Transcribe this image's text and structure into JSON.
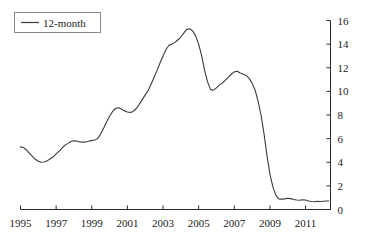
{
  "chart_data": {
    "type": "line",
    "title": "",
    "xlabel": "",
    "ylabel": "",
    "xlim": [
      1995.0,
      2012.4
    ],
    "ylim": [
      0,
      16
    ],
    "grid": false,
    "legend_position": "top-left",
    "y_ticks": [
      0,
      2,
      4,
      6,
      8,
      10,
      12,
      14,
      16
    ],
    "y_axis_side": "right",
    "x_ticks": [
      1995,
      1997,
      1999,
      2001,
      2003,
      2005,
      2007,
      2009,
      2011
    ],
    "x_tick_labels": [
      "1995",
      "1997",
      "1999",
      "2001",
      "2003",
      "2005",
      "2007",
      "2009",
      "2011"
    ],
    "series": [
      {
        "name": "12-month",
        "color": "#3a3a3a",
        "x": [
          1995.0,
          1995.17,
          1995.33,
          1995.5,
          1995.67,
          1995.83,
          1996.0,
          1996.17,
          1996.33,
          1996.5,
          1996.67,
          1996.83,
          1997.0,
          1997.17,
          1997.33,
          1997.5,
          1997.67,
          1997.83,
          1998.0,
          1998.17,
          1998.33,
          1998.5,
          1998.67,
          1998.83,
          1999.0,
          1999.17,
          1999.33,
          1999.5,
          1999.67,
          1999.83,
          2000.0,
          2000.17,
          2000.33,
          2000.5,
          2000.67,
          2000.83,
          2001.0,
          2001.17,
          2001.33,
          2001.5,
          2001.67,
          2001.83,
          2002.0,
          2002.17,
          2002.33,
          2002.5,
          2002.67,
          2002.83,
          2003.0,
          2003.17,
          2003.33,
          2003.5,
          2003.67,
          2003.83,
          2004.0,
          2004.17,
          2004.33,
          2004.5,
          2004.67,
          2004.83,
          2005.0,
          2005.17,
          2005.33,
          2005.5,
          2005.67,
          2005.83,
          2006.0,
          2006.17,
          2006.33,
          2006.5,
          2006.67,
          2006.83,
          2007.0,
          2007.17,
          2007.33,
          2007.5,
          2007.67,
          2007.83,
          2008.0,
          2008.17,
          2008.33,
          2008.5,
          2008.67,
          2008.83,
          2009.0,
          2009.17,
          2009.33,
          2009.5,
          2009.67,
          2009.83,
          2010.0,
          2010.17,
          2010.33,
          2010.5,
          2010.67,
          2010.83,
          2011.0,
          2011.17,
          2011.33,
          2011.5,
          2011.67,
          2011.83,
          2012.0,
          2012.17,
          2012.3
        ],
        "values": [
          5.3,
          5.25,
          5.05,
          4.75,
          4.5,
          4.25,
          4.08,
          4.0,
          4.02,
          4.12,
          4.3,
          4.45,
          4.7,
          4.95,
          5.2,
          5.45,
          5.6,
          5.75,
          5.82,
          5.8,
          5.72,
          5.7,
          5.72,
          5.78,
          5.85,
          5.88,
          6.0,
          6.4,
          6.9,
          7.4,
          7.9,
          8.3,
          8.55,
          8.62,
          8.5,
          8.35,
          8.25,
          8.22,
          8.3,
          8.55,
          8.9,
          9.3,
          9.7,
          10.1,
          10.6,
          11.2,
          11.8,
          12.4,
          13.0,
          13.55,
          13.9,
          14.0,
          14.15,
          14.35,
          14.6,
          14.95,
          15.25,
          15.3,
          15.1,
          14.7,
          14.0,
          13.0,
          11.8,
          10.8,
          10.15,
          10.1,
          10.3,
          10.55,
          10.7,
          10.95,
          11.2,
          11.45,
          11.65,
          11.7,
          11.55,
          11.45,
          11.35,
          11.1,
          10.7,
          10.1,
          9.2,
          8.0,
          6.4,
          4.6,
          3.0,
          1.9,
          1.2,
          0.9,
          0.88,
          0.9,
          0.95,
          0.92,
          0.85,
          0.8,
          0.78,
          0.82,
          0.8,
          0.72,
          0.68,
          0.66,
          0.7,
          0.68,
          0.7,
          0.72,
          0.72
        ]
      }
    ],
    "legend": [
      {
        "label": "12-month"
      }
    ]
  }
}
